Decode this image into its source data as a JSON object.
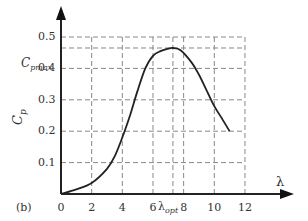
{
  "panel_label": "(b)",
  "chart_data": {
    "type": "line",
    "title": "",
    "xlabel": "λ",
    "ylabel": "Cp",
    "xlim": [
      0,
      12
    ],
    "ylim": [
      0,
      0.5
    ],
    "x_ticks": [
      "0",
      "2",
      "4",
      "6",
      "8",
      "10",
      "12"
    ],
    "y_ticks": [
      "0.1",
      "0.2",
      "0.3",
      "0.4",
      "0.5"
    ],
    "annotations": [
      {
        "text": "Cpmax",
        "axis": "y",
        "value": 0.465
      },
      {
        "text": "λopt",
        "axis": "x",
        "value": 7.3
      }
    ],
    "grid": true,
    "series": [
      {
        "name": "Cp(λ)",
        "x": [
          0,
          1,
          2,
          3,
          3.5,
          4,
          4.5,
          5,
          5.5,
          6,
          6.5,
          7,
          7.3,
          7.8,
          8.5,
          9,
          9.5,
          10,
          10.5,
          11
        ],
        "y": [
          0.0,
          0.015,
          0.035,
          0.08,
          0.12,
          0.18,
          0.25,
          0.33,
          0.4,
          0.44,
          0.455,
          0.463,
          0.465,
          0.458,
          0.42,
          0.38,
          0.33,
          0.28,
          0.24,
          0.2
        ]
      }
    ]
  },
  "labels": {
    "y_axis": "C",
    "y_axis_sub": "p",
    "x_axis": "λ",
    "cpmax_main": "C",
    "cpmax_sub": "pmax",
    "lopt_main": "λ",
    "lopt_sub": "opt"
  }
}
